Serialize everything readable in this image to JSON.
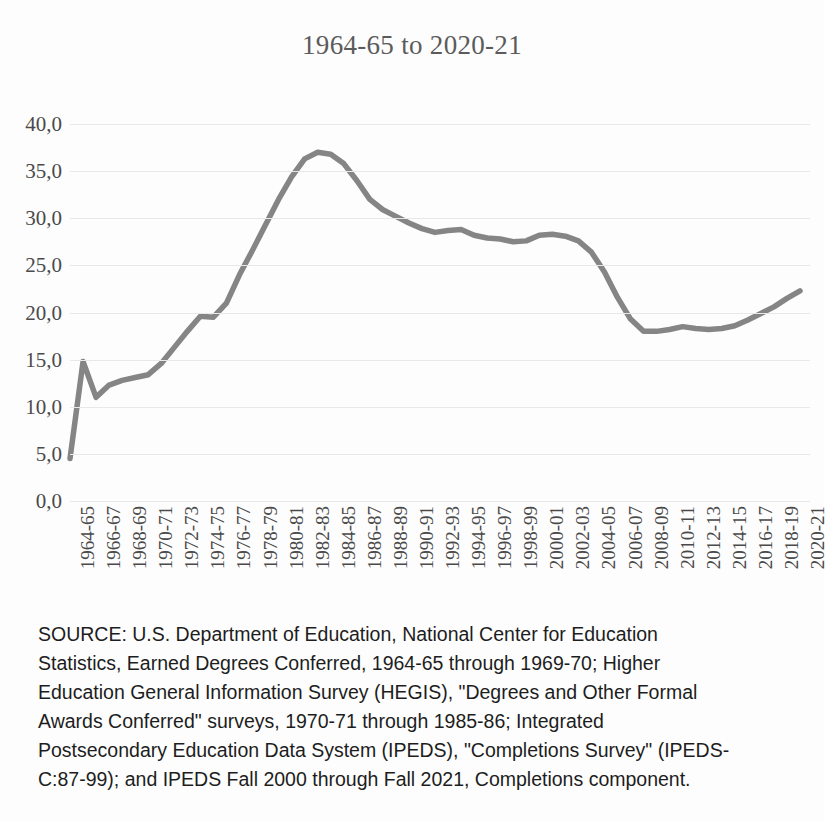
{
  "chart_data": {
    "type": "line",
    "title": "1964-65 to 2020-21",
    "xlabel": "",
    "ylabel": "",
    "ylim": [
      0,
      40
    ],
    "ytick_labels": [
      "40,0",
      "35,0",
      "30,0",
      "25,0",
      "20,0",
      "15,0",
      "10,0",
      "5,0",
      "0,0"
    ],
    "ytick_values": [
      40,
      35,
      30,
      25,
      20,
      15,
      10,
      5,
      0
    ],
    "grid": true,
    "legend": null,
    "line_color": "#858585",
    "decimal_separator": ",",
    "xtick_labels": [
      "1964-65",
      "1966-67",
      "1968-69",
      "1970-71",
      "1972-73",
      "1974-75",
      "1976-77",
      "1978-79",
      "1980-81",
      "1982-83",
      "1984-85",
      "1986-87",
      "1988-89",
      "1990-91",
      "1992-93",
      "1994-95",
      "1996-97",
      "1998-99",
      "2000-01",
      "2002-03",
      "2004-05",
      "2006-07",
      "2008-09",
      "2010-11",
      "2012-13",
      "2014-15",
      "2016-17",
      "2018-19",
      "2020-21"
    ],
    "categories": [
      "1964-65",
      "1965-66",
      "1966-67",
      "1967-68",
      "1968-69",
      "1969-70",
      "1970-71",
      "1971-72",
      "1972-73",
      "1973-74",
      "1974-75",
      "1975-76",
      "1976-77",
      "1977-78",
      "1978-79",
      "1979-80",
      "1980-81",
      "1981-82",
      "1982-83",
      "1983-84",
      "1984-85",
      "1985-86",
      "1986-87",
      "1987-88",
      "1988-89",
      "1989-90",
      "1990-91",
      "1991-92",
      "1992-93",
      "1993-94",
      "1994-95",
      "1995-96",
      "1996-97",
      "1997-98",
      "1998-99",
      "1999-00",
      "2000-01",
      "2001-02",
      "2002-03",
      "2003-04",
      "2004-05",
      "2005-06",
      "2006-07",
      "2007-08",
      "2008-09",
      "2009-10",
      "2010-11",
      "2011-12",
      "2012-13",
      "2013-14",
      "2014-15",
      "2015-16",
      "2016-17",
      "2017-18",
      "2018-19",
      "2019-20",
      "2020-21"
    ],
    "values": [
      4.5,
      14.8,
      11.0,
      12.3,
      12.8,
      13.1,
      13.4,
      14.6,
      16.3,
      18.0,
      19.6,
      19.5,
      21.0,
      24.0,
      26.6,
      29.3,
      32.0,
      34.4,
      36.3,
      37.0,
      36.8,
      35.8,
      34.0,
      32.0,
      30.9,
      30.2,
      29.5,
      28.9,
      28.5,
      28.7,
      28.8,
      28.2,
      27.9,
      27.8,
      27.5,
      27.6,
      28.2,
      28.3,
      28.1,
      27.6,
      26.4,
      24.3,
      21.6,
      19.3,
      18.0,
      18.0,
      18.2,
      18.5,
      18.3,
      18.2,
      18.3,
      18.6,
      19.2,
      19.9,
      20.6,
      21.5,
      22.3
    ]
  },
  "source": {
    "lines": [
      "SOURCE: U.S. Department of Education, National Center for Education",
      "Statistics, Earned Degrees Conferred, 1964-65 through 1969-70; Higher",
      "Education General Information Survey (HEGIS), \"Degrees and Other Formal",
      "Awards Conferred\" surveys, 1970-71 through 1985-86; Integrated",
      "Postsecondary Education Data System (IPEDS), \"Completions Survey\" (IPEDS-",
      "C:87-99); and IPEDS Fall 2000 through Fall 2021, Completions component."
    ]
  }
}
